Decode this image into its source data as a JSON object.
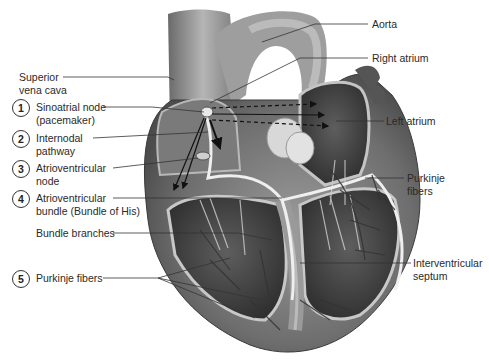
{
  "diagram": {
    "left_labels": [
      {
        "id": "superior-vena-cava",
        "number": "",
        "line1": "Superior",
        "line2": "vena cava"
      },
      {
        "id": "sinoatrial-node",
        "number": "1",
        "line1": "Sinoatrial node",
        "line2": "(pacemaker)"
      },
      {
        "id": "internodal-pathway",
        "number": "2",
        "line1": "Internodal",
        "line2": "pathway"
      },
      {
        "id": "atrioventricular-node",
        "number": "3",
        "line1": "Atrioventricular",
        "line2": "node"
      },
      {
        "id": "atrioventricular-bundle",
        "number": "4",
        "line1": "Atrioventricular",
        "line2": "bundle (Bundle of His)"
      },
      {
        "id": "bundle-branches",
        "number": "",
        "line1": "Bundle branches",
        "line2": ""
      },
      {
        "id": "purkinje-fibers-left",
        "number": "5",
        "line1": "Purkinje fibers",
        "line2": ""
      }
    ],
    "right_labels": [
      {
        "id": "aorta",
        "line1": "Aorta",
        "line2": ""
      },
      {
        "id": "right-atrium",
        "line1": "Right atrium",
        "line2": ""
      },
      {
        "id": "left-atrium",
        "line1": "Left atrium",
        "line2": ""
      },
      {
        "id": "purkinje-fibers-right",
        "line1": "Purkinje",
        "line2": "fibers"
      },
      {
        "id": "interventricular-septum",
        "line1": "Interventricular",
        "line2": "septum"
      }
    ],
    "colors": {
      "tissue_dark": "#4a4a4a",
      "tissue_mid": "#8a8a8a",
      "tissue_light": "#c8c8c8",
      "line": "#333333"
    }
  }
}
